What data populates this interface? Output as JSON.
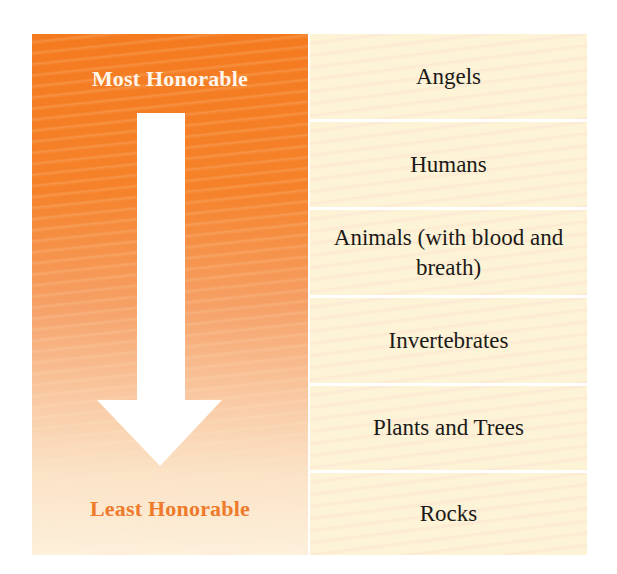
{
  "diagram": {
    "type": "hierarchy",
    "left_panel": {
      "top_label": "Most Honorable",
      "bottom_label": "Least Honorable",
      "arrow_direction": "down",
      "colors": {
        "gradient_top": "#f47a1f",
        "gradient_bottom": "#fdf0dc",
        "top_label_color": "#fff7ee",
        "bottom_label_color": "#ee7a2a",
        "arrow_color": "#ffffff"
      }
    },
    "ranks": [
      {
        "label": "Angels"
      },
      {
        "label": "Humans"
      },
      {
        "label": "Animals (with blood and breath)"
      },
      {
        "label": "Invertebrates"
      },
      {
        "label": "Plants and Trees"
      },
      {
        "label": "Rocks"
      }
    ],
    "colors": {
      "row_background": "#fdf3d6",
      "row_text": "#1c1a18",
      "divider": "#ffffff"
    }
  }
}
